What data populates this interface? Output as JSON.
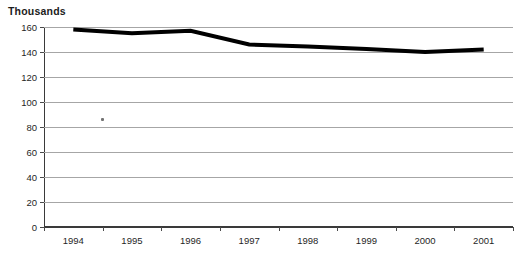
{
  "chart_data": {
    "type": "line",
    "title": "Thousands",
    "xlabel": "",
    "ylabel": "",
    "categories": [
      "1994",
      "1995",
      "1996",
      "1997",
      "1998",
      "1999",
      "2000",
      "2001"
    ],
    "series": [
      {
        "name": "Series 1",
        "values": [
          158,
          155,
          157,
          146,
          144.5,
          142.5,
          140,
          142
        ]
      }
    ],
    "ylim": [
      0,
      160
    ],
    "yticks": [
      0,
      20,
      40,
      60,
      80,
      100,
      120,
      140,
      160
    ],
    "ytick_labels": [
      "0",
      "20",
      "40",
      "60",
      "80",
      "100",
      "120",
      "140",
      "160"
    ],
    "grid": true,
    "grid_axis": "y",
    "legend": false,
    "legend_position": "none",
    "line_color": "#000000",
    "line_width_px": 4,
    "plot_background": "#ffffff",
    "gridline_color": "#a6a6a6",
    "axis_color": "#3a3a3a"
  },
  "artifacts": {
    "scan_speck_label": "scan-speck"
  }
}
